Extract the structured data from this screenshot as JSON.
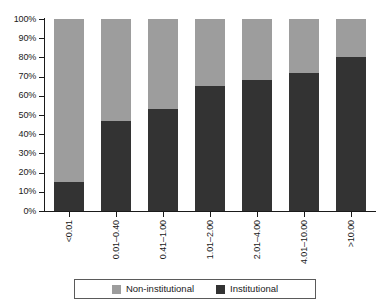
{
  "chart_data": {
    "type": "bar",
    "subtype": "100% stacked column",
    "title": "",
    "subtitle": "",
    "xlabel": "",
    "ylabel": "",
    "ylim": [
      0,
      100
    ],
    "y_unit": "%",
    "grid": false,
    "legend_position": "bottom",
    "categories": [
      "<0.01",
      "0.01–0.40",
      "0.41–1.00",
      "1.01–2.00",
      "2.01–4.00",
      "4.01–10.00",
      ">10.00"
    ],
    "ytick_labels": [
      "0%",
      "10%",
      "20%",
      "30%",
      "40%",
      "50%",
      "60%",
      "70%",
      "80%",
      "90%",
      "100%"
    ],
    "ytick_values": [
      0,
      10,
      20,
      30,
      40,
      50,
      60,
      70,
      80,
      90,
      100
    ],
    "series": [
      {
        "name": "Non-institutional",
        "color": "#9d9d9d",
        "values": [
          85,
          53,
          47,
          35,
          32,
          28,
          20
        ]
      },
      {
        "name": "Institutional",
        "color": "#333333",
        "values": [
          15,
          47,
          53,
          65,
          68,
          72,
          80
        ]
      }
    ]
  },
  "legend": {
    "items": [
      {
        "label": "Non-institutional",
        "color": "#9d9d9d"
      },
      {
        "label": "Institutional",
        "color": "#333333"
      }
    ]
  }
}
